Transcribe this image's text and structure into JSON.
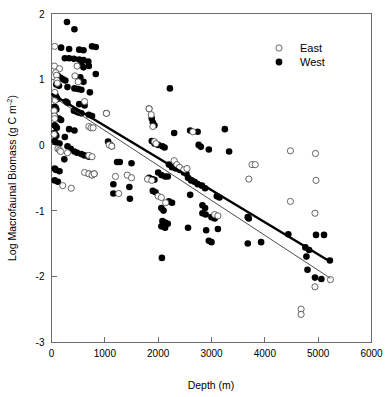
{
  "chart_data": {
    "type": "scatter",
    "title": "",
    "xlabel": "Depth (m)",
    "ylabel": "Log Macrofaunal Biomass (g C m²)",
    "ylabel_base": "Log Macrofaunal Biomass (g C m",
    "ylabel_exponent": "-2",
    "ylabel_close": ")",
    "xlim": [
      0,
      6000
    ],
    "ylim": [
      -3,
      2
    ],
    "xticks": [
      0,
      1000,
      2000,
      3000,
      4000,
      5000,
      6000
    ],
    "yticks": [
      2,
      1,
      0,
      -1,
      -2,
      -3
    ],
    "xtick_labels": [
      "0",
      "1000",
      "2000",
      "3000",
      "4000",
      "5000",
      "6000"
    ],
    "ytick_labels": [
      "2",
      "1",
      "0",
      "-1",
      "-2",
      "-3"
    ],
    "grid": false,
    "legend_position": "top-right",
    "legend": [
      {
        "name": "East",
        "marker": "open-circle"
      },
      {
        "name": "West",
        "marker": "filled-circle"
      }
    ],
    "series": [
      {
        "name": "West",
        "marker": "filled-circle",
        "color": "#000000",
        "points": [
          [
            290,
            1.87
          ],
          [
            430,
            1.76
          ],
          [
            180,
            1.48
          ],
          [
            330,
            1.46
          ],
          [
            520,
            1.45
          ],
          [
            600,
            1.44
          ],
          [
            760,
            1.5
          ],
          [
            830,
            1.49
          ],
          [
            250,
            1.32
          ],
          [
            330,
            1.32
          ],
          [
            420,
            1.31
          ],
          [
            520,
            1.3
          ],
          [
            600,
            1.29
          ],
          [
            690,
            1.27
          ],
          [
            560,
            1.22
          ],
          [
            600,
            1.18
          ],
          [
            700,
            1.2
          ],
          [
            830,
            1.08
          ],
          [
            120,
            1.05
          ],
          [
            170,
            1.02
          ],
          [
            215,
            1.0
          ],
          [
            260,
            0.98
          ],
          [
            540,
            1.03
          ],
          [
            600,
            0.96
          ],
          [
            90,
            0.92
          ],
          [
            140,
            0.9
          ],
          [
            300,
            0.88
          ],
          [
            430,
            0.86
          ],
          [
            500,
            0.85
          ],
          [
            560,
            0.84
          ],
          [
            720,
            0.8
          ],
          [
            60,
            0.78
          ],
          [
            70,
            0.76
          ],
          [
            80,
            0.74
          ],
          [
            95,
            0.72
          ],
          [
            110,
            0.7
          ],
          [
            270,
            0.66
          ],
          [
            300,
            0.64
          ],
          [
            520,
            0.62
          ],
          [
            620,
            0.6
          ],
          [
            60,
            0.58
          ],
          [
            80,
            0.56
          ],
          [
            90,
            0.54
          ],
          [
            420,
            0.52
          ],
          [
            480,
            0.5
          ],
          [
            520,
            0.49
          ],
          [
            560,
            0.48
          ],
          [
            2220,
            0.86
          ],
          [
            60,
            0.44
          ],
          [
            75,
            0.42
          ],
          [
            140,
            0.4
          ],
          [
            180,
            0.38
          ],
          [
            700,
            0.46
          ],
          [
            760,
            0.44
          ],
          [
            1030,
            0.48
          ],
          [
            1830,
            0.55
          ],
          [
            1880,
            0.4
          ],
          [
            1900,
            0.34
          ],
          [
            1930,
            0.3
          ],
          [
            2300,
            0.18
          ],
          [
            2600,
            0.22
          ],
          [
            2740,
            0.2
          ],
          [
            60,
            0.3
          ],
          [
            80,
            0.28
          ],
          [
            100,
            0.26
          ],
          [
            330,
            0.24
          ],
          [
            430,
            0.22
          ],
          [
            55,
            0.18
          ],
          [
            70,
            0.16
          ],
          [
            90,
            0.14
          ],
          [
            250,
            0.12
          ],
          [
            1060,
            0.05
          ],
          [
            1100,
            0.0
          ],
          [
            1130,
            -0.02
          ],
          [
            1880,
            0.06
          ],
          [
            1930,
            0.02
          ],
          [
            2000,
            0.0
          ],
          [
            2080,
            -0.02
          ],
          [
            2120,
            -0.04
          ],
          [
            2760,
            0.0
          ],
          [
            2800,
            -0.03
          ],
          [
            2950,
            -0.07
          ],
          [
            3250,
            0.24
          ],
          [
            3330,
            -0.1
          ],
          [
            60,
            0.06
          ],
          [
            80,
            0.04
          ],
          [
            150,
            0.02
          ],
          [
            300,
            -0.02
          ],
          [
            360,
            -0.06
          ],
          [
            430,
            -0.1
          ],
          [
            480,
            -0.12
          ],
          [
            560,
            -0.14
          ],
          [
            620,
            -0.16
          ],
          [
            240,
            -0.22
          ],
          [
            700,
            -0.18
          ],
          [
            1230,
            -0.26
          ],
          [
            1280,
            -0.26
          ],
          [
            1500,
            -0.28
          ],
          [
            2200,
            -0.3
          ],
          [
            2260,
            -0.34
          ],
          [
            2330,
            -0.36
          ],
          [
            2400,
            -0.38
          ],
          [
            2480,
            -0.42
          ],
          [
            2530,
            -0.44
          ],
          [
            2000,
            -0.42
          ],
          [
            2060,
            -0.46
          ],
          [
            2130,
            -0.48
          ],
          [
            2180,
            -0.48
          ],
          [
            60,
            -0.36
          ],
          [
            80,
            -0.38
          ],
          [
            150,
            -0.4
          ],
          [
            700,
            -0.44
          ],
          [
            760,
            -0.46
          ],
          [
            800,
            -0.44
          ],
          [
            1830,
            -0.5
          ],
          [
            1880,
            -0.52
          ],
          [
            1930,
            -0.53
          ],
          [
            2560,
            -0.5
          ],
          [
            2620,
            -0.54
          ],
          [
            2680,
            -0.56
          ],
          [
            2740,
            -0.6
          ],
          [
            2820,
            -0.62
          ],
          [
            2880,
            -0.66
          ],
          [
            1160,
            -0.6
          ],
          [
            1460,
            -0.64
          ],
          [
            60,
            -0.54
          ],
          [
            120,
            -0.56
          ],
          [
            1900,
            -0.7
          ],
          [
            1950,
            -0.72
          ],
          [
            2600,
            -0.76
          ],
          [
            3100,
            -0.78
          ],
          [
            3150,
            -0.8
          ],
          [
            1160,
            -0.74
          ],
          [
            1470,
            -0.82
          ],
          [
            2200,
            -0.86
          ],
          [
            2260,
            -0.88
          ],
          [
            2830,
            -0.92
          ],
          [
            2880,
            -0.96
          ],
          [
            2060,
            -0.96
          ],
          [
            2100,
            -1.0
          ],
          [
            2830,
            -1.04
          ],
          [
            2890,
            -1.06
          ],
          [
            3000,
            -1.1
          ],
          [
            3060,
            -1.12
          ],
          [
            2080,
            -1.16
          ],
          [
            2130,
            -1.18
          ],
          [
            2180,
            -1.2
          ],
          [
            2060,
            -1.24
          ],
          [
            2130,
            -1.26
          ],
          [
            2560,
            -1.26
          ],
          [
            3120,
            -1.28
          ],
          [
            2900,
            -1.3
          ],
          [
            2950,
            -1.46
          ],
          [
            3000,
            -1.48
          ],
          [
            3680,
            -1.1
          ],
          [
            3700,
            -1.12
          ],
          [
            3680,
            -1.5
          ],
          [
            3930,
            -1.48
          ],
          [
            2070,
            -1.72
          ],
          [
            4440,
            -1.36
          ],
          [
            4960,
            -1.37
          ],
          [
            5110,
            -1.37
          ],
          [
            4760,
            -1.56
          ],
          [
            4830,
            -1.6
          ],
          [
            4780,
            -1.7
          ],
          [
            5220,
            -1.76
          ],
          [
            4800,
            -1.9
          ],
          [
            4940,
            -2.02
          ],
          [
            5060,
            -2.04
          ]
        ]
      },
      {
        "name": "East",
        "marker": "open-circle",
        "color": "#ffffff",
        "points": [
          [
            60,
            1.5
          ],
          [
            55,
            1.2
          ],
          [
            150,
            1.16
          ],
          [
            480,
            1.2
          ],
          [
            80,
            1.1
          ],
          [
            95,
            1.06
          ],
          [
            100,
            0.98
          ],
          [
            110,
            0.94
          ],
          [
            440,
            1.05
          ],
          [
            500,
            0.96
          ],
          [
            60,
            0.8
          ],
          [
            70,
            0.68
          ],
          [
            620,
            0.66
          ],
          [
            50,
            0.52
          ],
          [
            55,
            0.44
          ],
          [
            60,
            0.4
          ],
          [
            700,
            0.28
          ],
          [
            740,
            0.26
          ],
          [
            780,
            0.26
          ],
          [
            1030,
            0.48
          ],
          [
            1080,
            0.0
          ],
          [
            1130,
            -0.02
          ],
          [
            1830,
            0.55
          ],
          [
            1870,
            0.46
          ],
          [
            1900,
            0.28
          ],
          [
            1930,
            0.05
          ],
          [
            1960,
            0.02
          ],
          [
            2650,
            0.2
          ],
          [
            50,
            0.16
          ],
          [
            120,
            -0.06
          ],
          [
            150,
            -0.08
          ],
          [
            170,
            -0.1
          ],
          [
            300,
            -0.12
          ],
          [
            700,
            -0.16
          ],
          [
            760,
            -0.18
          ],
          [
            2300,
            -0.24
          ],
          [
            2350,
            -0.3
          ],
          [
            2400,
            -0.34
          ],
          [
            2480,
            -0.38
          ],
          [
            2540,
            -0.36
          ],
          [
            620,
            -0.42
          ],
          [
            700,
            -0.44
          ],
          [
            760,
            -0.46
          ],
          [
            1200,
            -0.48
          ],
          [
            1420,
            -0.46
          ],
          [
            1500,
            -0.5
          ],
          [
            1800,
            -0.52
          ],
          [
            1880,
            -0.54
          ],
          [
            210,
            -0.62
          ],
          [
            370,
            -0.66
          ],
          [
            800,
            -0.44
          ],
          [
            1260,
            -0.74
          ],
          [
            2000,
            -0.78
          ],
          [
            2060,
            -0.8
          ],
          [
            2140,
            -0.88
          ],
          [
            3060,
            -1.06
          ],
          [
            3120,
            -1.08
          ],
          [
            3700,
            -0.52
          ],
          [
            3760,
            -0.3
          ],
          [
            3820,
            -0.3
          ],
          [
            4480,
            -0.09
          ],
          [
            4950,
            -0.13
          ],
          [
            4960,
            -0.54
          ],
          [
            4940,
            -1.04
          ],
          [
            4480,
            -0.86
          ],
          [
            5230,
            -2.05
          ],
          [
            4940,
            -2.16
          ],
          [
            4680,
            -2.5
          ],
          [
            4680,
            -2.58
          ]
        ]
      }
    ],
    "fit_lines": [
      {
        "name": "West",
        "style": "thick",
        "x_start": 0,
        "y_start": 0.78,
        "x_end": 5230,
        "y_end": -1.78
      },
      {
        "name": "East",
        "style": "thin",
        "x_start": 0,
        "y_start": 0.75,
        "x_end": 5230,
        "y_end": -2.03
      }
    ]
  },
  "axes": {
    "x_title": "Depth (m)",
    "y_title_base": "Log Macrofaunal Biomass (g C m",
    "y_title_exponent": "-2",
    "y_title_close": ")"
  }
}
